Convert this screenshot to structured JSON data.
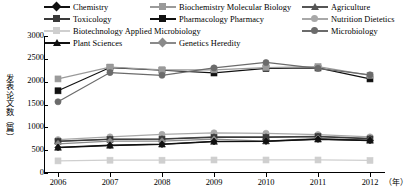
{
  "axes": {
    "y_label": "发表论文数（篇）",
    "y_ticks": [
      "3000",
      "2500",
      "2000",
      "1500",
      "1000",
      "500",
      "0"
    ],
    "x_ticks": [
      "2006",
      "2007",
      "2008",
      "2009",
      "2010",
      "2011",
      "2012"
    ],
    "x_unit": "（年）"
  },
  "legend": {
    "items": [
      {
        "label": "Chemistry",
        "marker": "diamond",
        "color": "#111111"
      },
      {
        "label": "Biochemistry Molecular Biology",
        "marker": "square",
        "color": "#9a9a9a"
      },
      {
        "label": "Agriculture",
        "marker": "triangle",
        "color": "#555555"
      },
      {
        "label": "Toxicology",
        "marker": "square",
        "color": "#3a3a3a"
      },
      {
        "label": "Pharmacology Pharmacy",
        "marker": "square",
        "color": "#111111"
      },
      {
        "label": "Nutrition Dietetics",
        "marker": "circle",
        "color": "#a8a8a8"
      },
      {
        "label": "Biotechnology Applied Microbiology",
        "marker": "square",
        "color": "#cfcfcf"
      },
      {
        "label": "Microbiology",
        "marker": "circle",
        "color": "#6b6b6b"
      },
      {
        "label": "Plant Sciences",
        "marker": "triangle",
        "color": "#111111"
      },
      {
        "label": "Genetics Heredity",
        "marker": "diamond",
        "color": "#8a8a8a"
      }
    ]
  },
  "chart_data": {
    "type": "line",
    "title": "",
    "xlabel": "（年）",
    "ylabel": "发表论文数（篇）",
    "x": [
      "2006",
      "2007",
      "2008",
      "2009",
      "2010",
      "2011",
      "2012"
    ],
    "ylim": [
      0,
      3000
    ],
    "ytick_step": 500,
    "grid": false,
    "legend_position": "top",
    "series": [
      {
        "name": "Pharmacology Pharmacy",
        "marker": "square",
        "color": "#111111",
        "values": [
          1800,
          2310,
          2250,
          2190,
          2290,
          2300,
          2060
        ]
      },
      {
        "name": "Biochemistry Molecular Biology",
        "marker": "square",
        "color": "#9a9a9a",
        "values": [
          2060,
          2320,
          2260,
          2260,
          2310,
          2330,
          2140
        ]
      },
      {
        "name": "Microbiology",
        "marker": "circle",
        "color": "#6b6b6b",
        "values": [
          1560,
          2200,
          2140,
          2300,
          2420,
          2290,
          2150
        ]
      },
      {
        "name": "Nutrition Dietetics",
        "marker": "circle",
        "color": "#a8a8a8",
        "values": [
          730,
          790,
          845,
          880,
          870,
          840,
          790
        ]
      },
      {
        "name": "Agriculture",
        "marker": "triangle",
        "color": "#555555",
        "values": [
          700,
          740,
          745,
          790,
          790,
          800,
          760
        ]
      },
      {
        "name": "Toxicology",
        "marker": "square",
        "color": "#3a3a3a",
        "values": [
          690,
          735,
          740,
          780,
          780,
          795,
          745
        ]
      },
      {
        "name": "Genetics Heredity",
        "marker": "diamond",
        "color": "#8a8a8a",
        "values": [
          640,
          700,
          700,
          740,
          700,
          760,
          720
        ]
      },
      {
        "name": "Chemistry",
        "marker": "diamond",
        "color": "#111111",
        "values": [
          560,
          610,
          630,
          690,
          700,
          740,
          715
        ]
      },
      {
        "name": "Plant Sciences",
        "marker": "triangle",
        "color": "#111111",
        "values": [
          555,
          600,
          625,
          685,
          695,
          735,
          710
        ]
      },
      {
        "name": "Biotechnology Applied Microbiology",
        "marker": "square",
        "color": "#cfcfcf",
        "values": [
          265,
          280,
          280,
          285,
          285,
          285,
          275
        ]
      }
    ]
  }
}
